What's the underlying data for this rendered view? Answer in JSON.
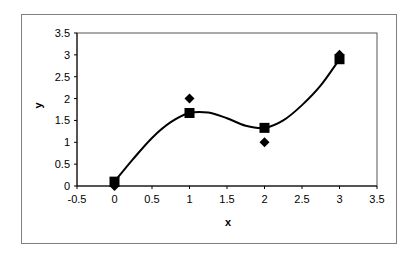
{
  "chart_data": {
    "type": "scatter",
    "title": "",
    "xlabel": "x",
    "ylabel": "y",
    "xlim": [
      -0.5,
      3.5
    ],
    "ylim": [
      0,
      3.5
    ],
    "x_ticks": [
      -0.5,
      0,
      0.5,
      1,
      1.5,
      2,
      2.5,
      3,
      3.5
    ],
    "y_ticks": [
      0,
      0.5,
      1,
      1.5,
      2,
      2.5,
      3,
      3.5
    ],
    "x_tick_labels": [
      "-0.5",
      "0",
      "0.5",
      "1",
      "1.5",
      "2",
      "2.5",
      "3",
      "3.5"
    ],
    "y_tick_labels": [
      "0",
      "0.5",
      "1",
      "1.5",
      "2",
      "2.5",
      "3",
      "3.5"
    ],
    "grid": false,
    "legend": null,
    "series": [
      {
        "name": "observed",
        "marker": "diamond",
        "x": [
          0,
          1,
          2,
          3
        ],
        "y": [
          0,
          2,
          1,
          3
        ]
      },
      {
        "name": "fitted",
        "marker": "square",
        "x": [
          0,
          1,
          2,
          3
        ],
        "y": [
          0.1,
          1.67,
          1.33,
          2.9
        ]
      },
      {
        "name": "smooth-curve",
        "marker": "none",
        "line": "smooth",
        "x": [
          0,
          0.25,
          0.5,
          0.75,
          1,
          1.25,
          1.5,
          1.75,
          2,
          2.25,
          2.5,
          2.75,
          3
        ],
        "y": [
          0.1,
          0.62,
          1.1,
          1.46,
          1.67,
          1.68,
          1.55,
          1.38,
          1.33,
          1.5,
          1.85,
          2.3,
          2.9
        ]
      }
    ]
  },
  "colors": {
    "markers": "#000000",
    "line": "#000000",
    "frame": "#808080",
    "axes": "#000000"
  }
}
